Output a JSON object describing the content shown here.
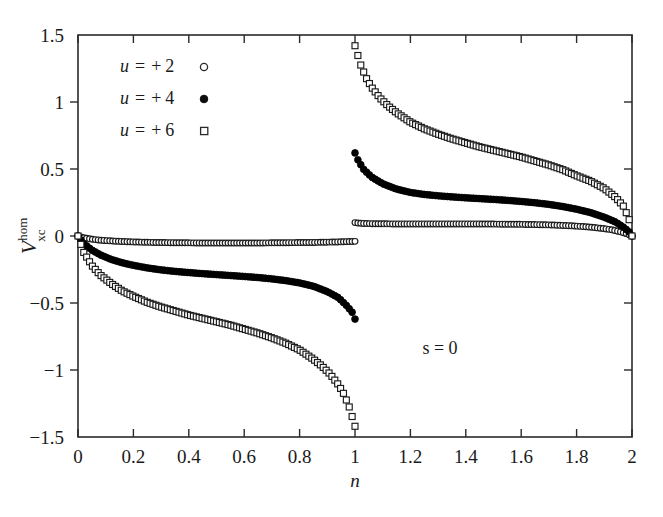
{
  "figure": {
    "background_color": "#ffffff",
    "foreground_color": "#1a1a1a"
  },
  "axes": {
    "x_label": "n",
    "y_label_base": "V",
    "y_label_sup": "hom",
    "y_label_sub": "xc",
    "x_ticks": [
      "0",
      "0.2",
      "0.4",
      "0.6",
      "0.8",
      "1",
      "1.2",
      "1.4",
      "1.6",
      "1.8",
      "2"
    ],
    "y_ticks": [
      "1.5",
      "1",
      "0.5",
      "0",
      "−0.5",
      "−1",
      "−1.5"
    ]
  },
  "legend": {
    "items": [
      {
        "var": "u",
        "eq": "=",
        "sign": "+",
        "value": "2",
        "label": "u = + 2",
        "marker": "open-circle"
      },
      {
        "var": "u",
        "eq": "=",
        "sign": "+",
        "value": "4",
        "label": "u = + 4",
        "marker": "filled-circle"
      },
      {
        "var": "u",
        "eq": "=",
        "sign": "+",
        "value": "6",
        "label": "u = + 6",
        "marker": "open-square"
      }
    ]
  },
  "annotations": [
    {
      "name": "s-equals-zero",
      "text": "s = 0"
    }
  ],
  "chart_data": {
    "type": "scatter",
    "title": "",
    "xlabel": "n",
    "ylabel": "V_xc^hom",
    "xlim": [
      0,
      2
    ],
    "ylim": [
      -1.5,
      1.5
    ],
    "xticks": [
      0,
      0.2,
      0.4,
      0.6,
      0.8,
      1.0,
      1.2,
      1.4,
      1.6,
      1.8,
      2.0
    ],
    "yticks": [
      -1.5,
      -1.0,
      -0.5,
      0.0,
      0.5,
      1.0,
      1.5
    ],
    "grid": false,
    "legend_position": "upper-left",
    "series": [
      {
        "name": "u = + 2",
        "marker": "open-circle",
        "color": "#1a1a1a",
        "branches": [
          {
            "branch": "n<1",
            "x": [
              0.0,
              0.02,
              0.05,
              0.08,
              0.12,
              0.16,
              0.2,
              0.25,
              0.3,
              0.35,
              0.4,
              0.45,
              0.5,
              0.55,
              0.6,
              0.65,
              0.7,
              0.75,
              0.8,
              0.85,
              0.9,
              0.94,
              0.97,
              0.99,
              1.0
            ],
            "y": [
              0.0,
              -0.013,
              -0.024,
              -0.031,
              -0.037,
              -0.041,
              -0.044,
              -0.047,
              -0.049,
              -0.05,
              -0.051,
              -0.052,
              -0.052,
              -0.052,
              -0.052,
              -0.052,
              -0.051,
              -0.05,
              -0.049,
              -0.048,
              -0.046,
              -0.044,
              -0.042,
              -0.041,
              -0.04
            ]
          },
          {
            "branch": "n>1",
            "x": [
              1.0,
              1.01,
              1.03,
              1.06,
              1.1,
              1.15,
              1.2,
              1.25,
              1.3,
              1.35,
              1.4,
              1.45,
              1.5,
              1.55,
              1.6,
              1.65,
              1.7,
              1.75,
              1.8,
              1.85,
              1.9,
              1.93,
              1.96,
              1.98,
              2.0
            ],
            "y": [
              0.1,
              0.097,
              0.094,
              0.092,
              0.091,
              0.09,
              0.09,
              0.09,
              0.09,
              0.09,
              0.09,
              0.09,
              0.089,
              0.088,
              0.087,
              0.085,
              0.083,
              0.079,
              0.074,
              0.066,
              0.055,
              0.045,
              0.03,
              0.018,
              0.0
            ]
          }
        ]
      },
      {
        "name": "u = + 4",
        "marker": "filled-circle",
        "color": "#000000",
        "branches": [
          {
            "branch": "n<1",
            "x": [
              0.0,
              0.02,
              0.05,
              0.08,
              0.12,
              0.16,
              0.2,
              0.25,
              0.3,
              0.35,
              0.4,
              0.45,
              0.5,
              0.55,
              0.6,
              0.65,
              0.7,
              0.75,
              0.8,
              0.85,
              0.9,
              0.94,
              0.97,
              0.99,
              1.0
            ],
            "y": [
              0.0,
              -0.055,
              -0.105,
              -0.14,
              -0.175,
              -0.2,
              -0.219,
              -0.238,
              -0.253,
              -0.264,
              -0.273,
              -0.281,
              -0.288,
              -0.295,
              -0.302,
              -0.31,
              -0.32,
              -0.333,
              -0.35,
              -0.375,
              -0.415,
              -0.46,
              -0.52,
              -0.57,
              -0.62
            ]
          },
          {
            "branch": "n>1",
            "x": [
              1.0,
              1.01,
              1.03,
              1.06,
              1.1,
              1.15,
              1.2,
              1.25,
              1.3,
              1.35,
              1.4,
              1.45,
              1.5,
              1.55,
              1.6,
              1.65,
              1.7,
              1.75,
              1.8,
              1.85,
              1.9,
              1.94,
              1.97,
              1.99,
              2.0
            ],
            "y": [
              0.62,
              0.57,
              0.5,
              0.44,
              0.39,
              0.35,
              0.325,
              0.31,
              0.3,
              0.292,
              0.285,
              0.279,
              0.273,
              0.266,
              0.258,
              0.248,
              0.236,
              0.22,
              0.2,
              0.175,
              0.14,
              0.105,
              0.065,
              0.03,
              0.0
            ]
          }
        ]
      },
      {
        "name": "u = + 6",
        "marker": "open-square",
        "color": "#1a1a1a",
        "branches": [
          {
            "branch": "n<1",
            "x": [
              0.0,
              0.02,
              0.05,
              0.08,
              0.12,
              0.16,
              0.2,
              0.25,
              0.3,
              0.35,
              0.4,
              0.45,
              0.5,
              0.55,
              0.6,
              0.65,
              0.7,
              0.75,
              0.8,
              0.85,
              0.88,
              0.91,
              0.94,
              0.96,
              0.98,
              0.99,
              1.0
            ],
            "y": [
              0.0,
              -0.12,
              -0.22,
              -0.29,
              -0.355,
              -0.41,
              -0.45,
              -0.495,
              -0.53,
              -0.56,
              -0.59,
              -0.615,
              -0.64,
              -0.665,
              -0.695,
              -0.725,
              -0.76,
              -0.8,
              -0.85,
              -0.92,
              -0.97,
              -1.03,
              -1.11,
              -1.18,
              -1.28,
              -1.35,
              -1.42
            ]
          },
          {
            "branch": "n>1",
            "x": [
              1.0,
              1.01,
              1.02,
              1.04,
              1.06,
              1.09,
              1.12,
              1.15,
              1.2,
              1.25,
              1.3,
              1.35,
              1.4,
              1.45,
              1.5,
              1.55,
              1.6,
              1.65,
              1.7,
              1.75,
              1.8,
              1.85,
              1.9,
              1.94,
              1.97,
              1.99,
              2.0
            ],
            "y": [
              1.42,
              1.35,
              1.28,
              1.18,
              1.11,
              1.03,
              0.97,
              0.92,
              0.85,
              0.8,
              0.76,
              0.725,
              0.695,
              0.665,
              0.64,
              0.615,
              0.59,
              0.56,
              0.53,
              0.495,
              0.45,
              0.41,
              0.355,
              0.29,
              0.22,
              0.12,
              0.0
            ]
          }
        ]
      }
    ]
  }
}
